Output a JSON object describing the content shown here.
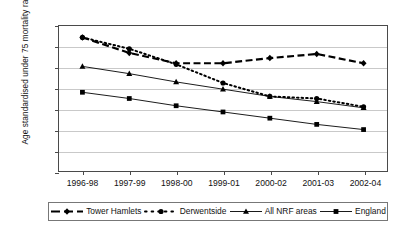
{
  "chart_data": {
    "type": "line",
    "title": "",
    "xlabel": "",
    "ylabel": "Age standardised under 75 mortality rate",
    "categories": [
      "1996-98",
      "1997-99",
      "1998-00",
      "1999-01",
      "2000-02",
      "2001-03",
      "2002-04"
    ],
    "ylim": [
      60,
      200
    ],
    "yticks": [
      60,
      80,
      100,
      120,
      140,
      160,
      180,
      200
    ],
    "grid": true,
    "legend_position": "bottom",
    "series": [
      {
        "name": "Tower Hamlets",
        "marker": "diamond",
        "line_style": "dashed",
        "color": "#000000",
        "values": [
          189,
          174,
          164,
          164,
          169,
          173,
          164
        ]
      },
      {
        "name": "Derwentside",
        "marker": "circle",
        "line_style": "dotted",
        "color": "#000000",
        "values": [
          189,
          178,
          163,
          145,
          132,
          130,
          122
        ]
      },
      {
        "name": "All NRF areas",
        "marker": "triangle",
        "line_style": "solid",
        "color": "#000000",
        "values": [
          161,
          154,
          146,
          139,
          132,
          127,
          121
        ]
      },
      {
        "name": "England",
        "marker": "square",
        "line_style": "solid",
        "color": "#000000",
        "values": [
          136,
          130,
          123,
          117,
          111,
          105,
          100
        ]
      }
    ]
  }
}
